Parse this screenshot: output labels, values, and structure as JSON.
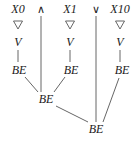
{
  "diagram": {
    "type": "derivation-tree",
    "width": 139,
    "height": 145,
    "stroke_color": "#555555",
    "text_color": "#1a1a1a",
    "background": "#ffffff",
    "top_row": [
      {
        "label": "X0",
        "kind": "variable",
        "x": 18,
        "y": 9
      },
      {
        "label": "∧",
        "kind": "operator-and",
        "x": 41,
        "y": 9
      },
      {
        "label": "X1",
        "kind": "variable",
        "x": 70,
        "y": 9
      },
      {
        "label": "∨",
        "kind": "operator-or",
        "x": 96,
        "y": 9
      },
      {
        "label": "X10",
        "kind": "variable",
        "x": 120,
        "y": 9
      }
    ],
    "nabla_row": [
      {
        "name": "nabla-x0",
        "x": 18,
        "y": 25
      },
      {
        "name": "nabla-x1",
        "x": 70,
        "y": 25
      },
      {
        "name": "nabla-x10",
        "x": 120,
        "y": 25
      }
    ],
    "v_row": [
      {
        "label": "V",
        "x": 18,
        "y": 42
      },
      {
        "label": "V",
        "x": 70,
        "y": 42
      },
      {
        "label": "V",
        "x": 120,
        "y": 42
      }
    ],
    "be_nodes": [
      {
        "label": "BE",
        "name": "be-left",
        "x": 19,
        "y": 70
      },
      {
        "label": "BE",
        "name": "be-middle-top",
        "x": 71,
        "y": 70
      },
      {
        "label": "BE",
        "name": "be-right",
        "x": 122,
        "y": 70
      },
      {
        "label": "BE",
        "name": "be-join-upper",
        "x": 46,
        "y": 99
      },
      {
        "label": "BE",
        "name": "be-join-lower",
        "x": 96,
        "y": 129
      }
    ],
    "edges": [
      {
        "name": "edge-v-to-be-left",
        "x1": 18,
        "y1": 50,
        "x2": 18,
        "y2": 62
      },
      {
        "name": "edge-v-to-be-mid",
        "x1": 70,
        "y1": 50,
        "x2": 70,
        "y2": 62
      },
      {
        "name": "edge-v-to-be-right",
        "x1": 120,
        "y1": 50,
        "x2": 120,
        "y2": 62
      },
      {
        "name": "edge-and-trunk",
        "x1": 41,
        "y1": 16,
        "x2": 41,
        "y2": 92
      },
      {
        "name": "edge-or-trunk",
        "x1": 96,
        "y1": 16,
        "x2": 96,
        "y2": 122
      },
      {
        "name": "edge-be-left-join",
        "x1": 25,
        "y1": 77,
        "x2": 38,
        "y2": 92
      },
      {
        "name": "edge-be-mid-join",
        "x1": 65,
        "y1": 77,
        "x2": 54,
        "y2": 92
      },
      {
        "name": "edge-join-to-lower",
        "x1": 56,
        "y1": 106,
        "x2": 88,
        "y2": 122
      },
      {
        "name": "edge-be-right-lower",
        "x1": 119,
        "y1": 78,
        "x2": 103,
        "y2": 122
      }
    ]
  }
}
